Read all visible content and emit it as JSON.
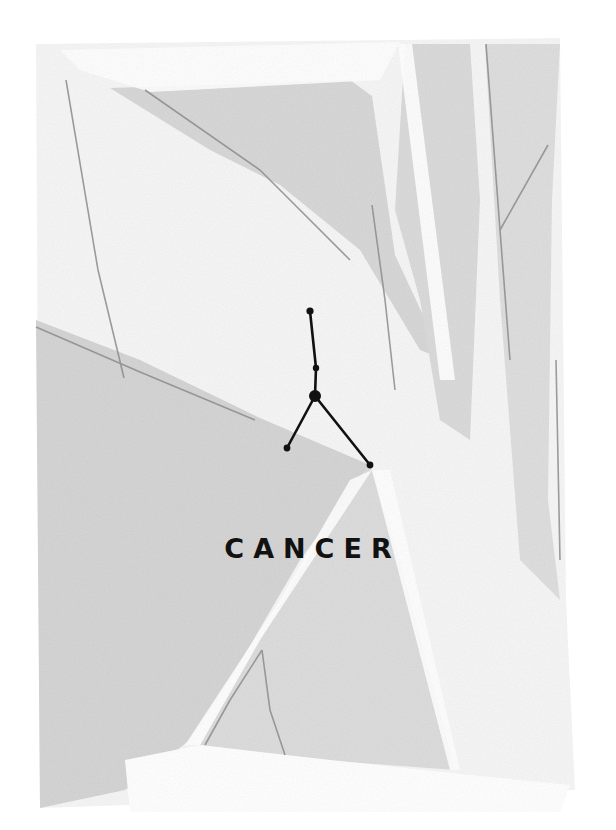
{
  "poster": {
    "title": "CANCER",
    "colors": {
      "background": "#ffffff",
      "wash_light": "#e2e2e2",
      "wash_mid": "#cfcfcf",
      "pencil": "#8a8a8a",
      "ink": "#111111"
    }
  },
  "constellation": {
    "name": "cancer-constellation",
    "stars": [
      {
        "x": 310,
        "y": 311,
        "r": 3.6
      },
      {
        "x": 316,
        "y": 368,
        "r": 3.2
      },
      {
        "x": 315,
        "y": 396,
        "r": 6
      },
      {
        "x": 287,
        "y": 448,
        "r": 3.4
      },
      {
        "x": 370,
        "y": 465,
        "r": 3.4
      }
    ],
    "lines": [
      [
        0,
        1
      ],
      [
        1,
        2
      ],
      [
        2,
        3
      ],
      [
        2,
        4
      ]
    ]
  }
}
